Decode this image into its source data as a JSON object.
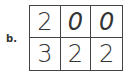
{
  "label": "b.",
  "grid": {
    "rows": [
      [
        "2",
        "0",
        "0"
      ],
      [
        "3",
        "2",
        "2"
      ]
    ]
  }
}
